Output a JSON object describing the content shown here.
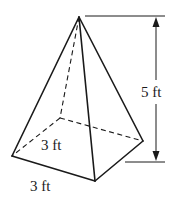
{
  "figure": {
    "labels": {
      "height": "5 ft",
      "base_depth": "3 ft",
      "base_width": "3 ft"
    },
    "colors": {
      "line": "#1a1a1a",
      "background": "#ffffff"
    }
  }
}
